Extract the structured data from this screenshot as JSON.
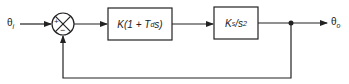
{
  "input_signal": {
    "symbol": "θ",
    "sub": "i"
  },
  "output_signal": {
    "symbol": "θ",
    "sub": "o"
  },
  "summing_junction": {
    "plus_sign": "+",
    "minus_sign": "−"
  },
  "blocks": [
    {
      "name": "controller",
      "pre": "K(1 + T",
      "sub": "d",
      "post": "s)"
    },
    {
      "name": "plant",
      "pre": "K",
      "sub": "s",
      "mid": "/s",
      "sup": "2"
    }
  ],
  "colors": {
    "line": "#222222",
    "background": "#ffffff"
  }
}
